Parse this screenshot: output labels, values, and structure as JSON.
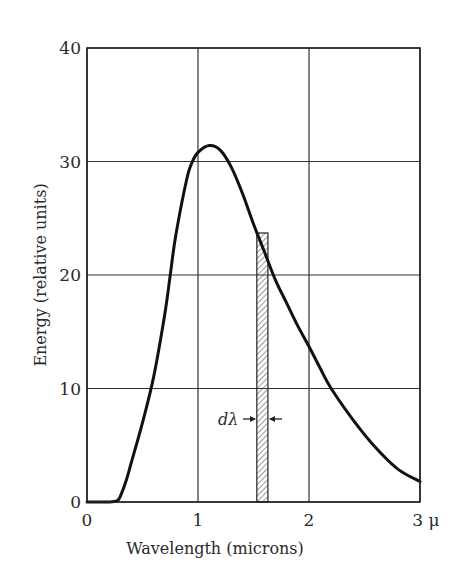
{
  "chart_data": {
    "type": "line",
    "title": "",
    "xlabel": "Wavelength (microns)",
    "ylabel": "Energy (relative units)",
    "xlim": [
      0,
      3
    ],
    "ylim": [
      0,
      40
    ],
    "grid": true,
    "x_ticks": [
      "0",
      "1",
      "2",
      "3"
    ],
    "x_unit_suffix": "μ",
    "y_ticks": [
      "0",
      "10",
      "20",
      "30",
      "40"
    ],
    "series": [
      {
        "name": "Energy distribution",
        "x": [
          0.0,
          0.2,
          0.27,
          0.3,
          0.35,
          0.4,
          0.5,
          0.6,
          0.7,
          0.75,
          0.8,
          0.9,
          0.95,
          1.0,
          1.1,
          1.2,
          1.3,
          1.4,
          1.5,
          1.6,
          1.7,
          1.8,
          1.9,
          2.0,
          2.1,
          2.2,
          2.4,
          2.6,
          2.8,
          3.0
        ],
        "y": [
          0.0,
          0.0,
          0.1,
          0.5,
          1.8,
          3.5,
          7.0,
          11.0,
          16.5,
          20.0,
          23.5,
          28.5,
          30.0,
          30.8,
          31.4,
          31.0,
          29.5,
          27.2,
          24.5,
          22.0,
          19.5,
          17.5,
          15.5,
          13.7,
          11.8,
          10.0,
          7.2,
          4.8,
          2.9,
          1.8
        ]
      }
    ],
    "annotations": [
      {
        "type": "hatched_band",
        "x_start": 1.53,
        "x_end": 1.63,
        "height": 23.7,
        "label": "dλ"
      }
    ]
  },
  "labels": {
    "x_axis": "Wavelength (microns)",
    "y_axis": "Energy (relative units)",
    "x_unit": "μ",
    "band_label": "dλ",
    "y_ticks": [
      "0",
      "10",
      "20",
      "30",
      "40"
    ],
    "x_ticks": [
      "0",
      "1",
      "2",
      "3"
    ]
  }
}
